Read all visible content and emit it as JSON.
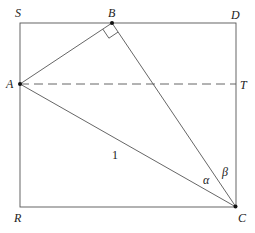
{
  "diagram": {
    "type": "geometry",
    "points": {
      "S": {
        "label": "S",
        "x": 20,
        "y": 23
      },
      "B": {
        "label": "B",
        "x": 112,
        "y": 23
      },
      "D": {
        "label": "D",
        "x": 236,
        "y": 23
      },
      "A": {
        "label": "A",
        "x": 20,
        "y": 84
      },
      "T": {
        "label": "T",
        "x": 236,
        "y": 84
      },
      "R": {
        "label": "R",
        "x": 20,
        "y": 207
      },
      "C": {
        "label": "C",
        "x": 236,
        "y": 207
      }
    },
    "labels": {
      "S": "S",
      "B": "B",
      "D": "D",
      "A": "A",
      "T": "T",
      "R": "R",
      "C": "C",
      "side_AC": "1",
      "angle_alpha": "α",
      "angle_beta": "β"
    },
    "segments": [
      {
        "from": "S",
        "to": "D",
        "style": "solid",
        "desc": "rectangle top edge"
      },
      {
        "from": "D",
        "to": "C",
        "style": "solid",
        "desc": "rectangle right edge"
      },
      {
        "from": "C",
        "to": "R",
        "style": "solid",
        "desc": "rectangle bottom edge"
      },
      {
        "from": "R",
        "to": "S",
        "style": "solid",
        "desc": "rectangle left edge"
      },
      {
        "from": "A",
        "to": "B",
        "style": "solid"
      },
      {
        "from": "B",
        "to": "C",
        "style": "solid"
      },
      {
        "from": "A",
        "to": "C",
        "style": "solid",
        "length_label": "1"
      },
      {
        "from": "A",
        "to": "T",
        "style": "dashed"
      }
    ],
    "right_angle_at": "B",
    "angles": [
      {
        "name": "alpha",
        "symbol": "α",
        "at": "C",
        "between": [
          "CA",
          "CB"
        ]
      },
      {
        "name": "beta",
        "symbol": "β",
        "at": "C",
        "between": [
          "CB",
          "CD"
        ]
      }
    ],
    "dots": [
      "A",
      "B",
      "C"
    ]
  }
}
